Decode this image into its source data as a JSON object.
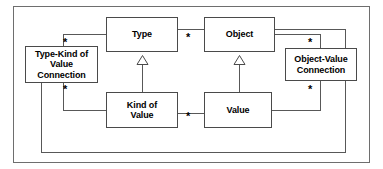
{
  "diagram": {
    "type": "uml-class-diagram",
    "frame": {
      "border_color": "#6e6e6e"
    },
    "line_color": "#585858",
    "node_border_color": "#4a4a4a",
    "node_fill": "#ffffff",
    "multiplicity_symbol": "*",
    "nodes": [
      {
        "id": "type-kind-of-value-connection",
        "label": "Type-Kind of\nValue\nConnection",
        "x": 25,
        "y": 46,
        "w": 73,
        "h": 37
      },
      {
        "id": "type",
        "label": "Type",
        "x": 106,
        "y": 17,
        "w": 72,
        "h": 35
      },
      {
        "id": "object",
        "label": "Object",
        "x": 204,
        "y": 17,
        "w": 71,
        "h": 35
      },
      {
        "id": "object-value-connection",
        "label": "Object-Value\nConnection",
        "x": 285,
        "y": 48,
        "w": 72,
        "h": 33
      },
      {
        "id": "kind-of-value",
        "label": "Kind of\nValue",
        "x": 106,
        "y": 92,
        "w": 72,
        "h": 36
      },
      {
        "id": "value",
        "label": "Value",
        "x": 204,
        "y": 92,
        "w": 68,
        "h": 36
      }
    ],
    "generalizations": [
      {
        "id": "kind-of-value-to-type",
        "child": "kind-of-value",
        "parent": "type"
      },
      {
        "id": "value-to-object",
        "child": "value",
        "parent": "object"
      }
    ],
    "associations": [
      {
        "id": "type-to-type-kind-connection",
        "from": "type",
        "to": "type-kind-of-value-connection",
        "multiplicity": "*"
      },
      {
        "id": "kind-of-value-to-type-kind-connection",
        "from": "kind-of-value",
        "to": "type-kind-of-value-connection",
        "multiplicity": "*"
      },
      {
        "id": "type-to-object",
        "from": "type",
        "to": "object",
        "multiplicity": "*"
      },
      {
        "id": "object-to-object-value-connection",
        "from": "object",
        "to": "object-value-connection",
        "multiplicity": "*"
      },
      {
        "id": "value-to-object-value-connection",
        "from": "value",
        "to": "object-value-connection",
        "multiplicity": "*"
      },
      {
        "id": "kind-of-value-to-value",
        "from": "kind-of-value",
        "to": "value",
        "multiplicity": "*"
      },
      {
        "id": "type-kind-connection-to-object-value-connection",
        "from": "type-kind-of-value-connection",
        "to": "object-value-connection",
        "multiplicity": ""
      }
    ],
    "multiplicity_markers": [
      {
        "id": "mult-type-left",
        "symbol": "*",
        "x": 63,
        "y": 38
      },
      {
        "id": "mult-type-object",
        "symbol": "*",
        "x": 186,
        "y": 33
      },
      {
        "id": "mult-object-right",
        "symbol": "*",
        "x": 308,
        "y": 38
      },
      {
        "id": "mult-kind-of-value-left",
        "symbol": "*",
        "x": 63,
        "y": 85
      },
      {
        "id": "mult-object-value-lower",
        "symbol": "*",
        "x": 308,
        "y": 85
      },
      {
        "id": "mult-kind-value",
        "symbol": "*",
        "x": 186,
        "y": 112
      }
    ]
  }
}
